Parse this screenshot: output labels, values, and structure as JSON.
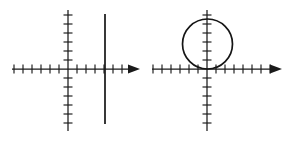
{
  "figure": {
    "background_color": "#ffffff",
    "ink_color": "#1a1a1a",
    "panel_count": 2
  },
  "chart_data": [
    {
      "type": "line",
      "panel": "left",
      "title": "Vertical line graph on coordinate axes",
      "xlabel": "",
      "ylabel": "",
      "grid": false,
      "legend": null,
      "axes": {
        "origin_px": {
          "x": 68,
          "y": 69
        },
        "x_axis": {
          "start_px": 12,
          "end_px": 140,
          "arrow": "right",
          "tick_spacing_px": 9,
          "tick_length_px": 9,
          "tick_count_left_of_origin": 6,
          "tick_count_right_of_origin": 7
        },
        "y_axis": {
          "start_px": 10,
          "end_px": 131,
          "arrow": "none",
          "tick_spacing_px": 9,
          "tick_length_px": 9,
          "tick_count_above_origin": 6,
          "tick_count_below_origin": 6
        }
      },
      "series": [
        {
          "name": "vertical line x = 4",
          "shape": "vertical-segment",
          "x": 4,
          "x_px": 105,
          "y_top_px": 14,
          "y_bottom_px": 124,
          "color": "#151515"
        }
      ],
      "xlim": [
        -6.2,
        8
      ],
      "ylim": [
        -6.2,
        6.6
      ]
    },
    {
      "type": "line",
      "panel": "right",
      "title": "Circle tangent to the x-axis at the origin",
      "xlabel": "",
      "ylabel": "",
      "grid": false,
      "legend": null,
      "axes": {
        "origin_px": {
          "x": 207,
          "y": 69
        },
        "x_axis": {
          "start_px": 152,
          "end_px": 282,
          "arrow": "right",
          "tick_spacing_px": 9,
          "tick_length_px": 9,
          "tick_count_left_of_origin": 6,
          "tick_count_right_of_origin": 7
        },
        "y_axis": {
          "start_px": 10,
          "end_px": 131,
          "arrow": "none",
          "tick_spacing_px": 9,
          "tick_length_px": 9,
          "tick_count_above_origin": 6,
          "tick_count_below_origin": 6
        }
      },
      "series": [
        {
          "name": "circle tangent to x-axis at origin",
          "shape": "circle",
          "center": [
            -0.3,
            2.75
          ],
          "center_px": {
            "x": 207.5,
            "y": 44
          },
          "radius": 2.75,
          "radius_px": 25,
          "color": "#151515"
        }
      ],
      "xlim": [
        -6.2,
        8.3
      ],
      "ylim": [
        -6.2,
        6.6
      ]
    }
  ]
}
